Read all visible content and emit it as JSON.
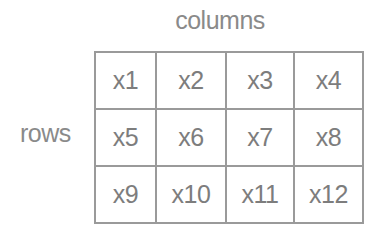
{
  "diagram": {
    "column_label": "columns",
    "row_label": "rows",
    "cells": [
      [
        "x1",
        "x2",
        "x3",
        "x4"
      ],
      [
        "x5",
        "x6",
        "x7",
        "x8"
      ],
      [
        "x9",
        "x10",
        "x11",
        "x12"
      ]
    ],
    "colors": {
      "border": "#9a9a9a",
      "text": "#7d7d7d",
      "background": "#ffffff"
    }
  }
}
